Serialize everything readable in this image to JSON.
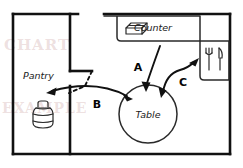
{
  "diagram": {
    "rooms": [
      {
        "id": "pantry",
        "label": "Pantry"
      },
      {
        "id": "kitchen",
        "label": ""
      }
    ],
    "furniture": [
      {
        "id": "counter",
        "label": "Counter",
        "icon": "box-3d-icon"
      },
      {
        "id": "table",
        "label": "Table",
        "icon": "circle-table-icon"
      },
      {
        "id": "utensils",
        "label": "",
        "icon": "fork-and-knife-icon"
      },
      {
        "id": "jar",
        "label": "",
        "icon": "jar-canister-icon"
      }
    ],
    "routes": [
      {
        "id": "route-a",
        "label": "A",
        "from": "counter",
        "to": "table",
        "direction": "one-way"
      },
      {
        "id": "route-b",
        "label": "B",
        "from": "pantry",
        "to": "table",
        "direction": "two-way"
      },
      {
        "id": "route-c",
        "label": "C",
        "from": "table",
        "to": "utensils",
        "direction": "two-way"
      }
    ],
    "colors": {
      "wall": "#111111",
      "furniture": "#2a2a2a",
      "arrow": "#111111",
      "background": "#ffffff",
      "watermark": "rgba(196,150,150,0.30)"
    }
  },
  "watermark": {
    "line1": "CHART",
    "line2": "EXAMPLE"
  }
}
